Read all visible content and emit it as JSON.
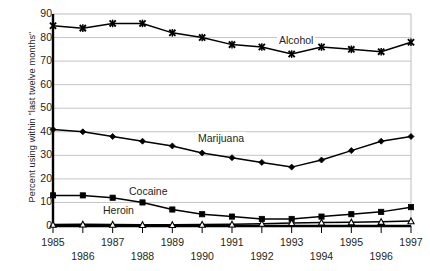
{
  "chart_data": {
    "type": "line",
    "title": "",
    "xlabel": "",
    "ylabel": "Percent using within \"last twelve months\"",
    "x": [
      1985,
      1986,
      1987,
      1988,
      1989,
      1990,
      1991,
      1992,
      1993,
      1994,
      1995,
      1996,
      1997
    ],
    "categories": [
      "1985",
      "1986",
      "1987",
      "1988",
      "1989",
      "1990",
      "1991",
      "1992",
      "1993",
      "1994",
      "1995",
      "1996",
      "1997"
    ],
    "xlim": [
      1985,
      1997
    ],
    "ylim": [
      0,
      90
    ],
    "yticks": [
      0,
      10,
      20,
      30,
      40,
      50,
      60,
      70,
      80,
      90
    ],
    "ytick_labels": [
      "0",
      "10",
      "20",
      "30",
      "40",
      "50",
      "60",
      "70",
      "80",
      "90"
    ],
    "grid": "horizontal",
    "legend": "inline-labels",
    "series": [
      {
        "name": "Alcohol",
        "marker": "x-cross",
        "values": [
          85,
          84,
          86,
          86,
          82,
          80,
          77,
          76,
          73,
          76,
          75,
          74,
          78
        ]
      },
      {
        "name": "Marijuana",
        "marker": "diamond",
        "values": [
          41,
          40,
          38,
          36,
          34,
          31,
          29,
          27,
          25,
          28,
          32,
          36,
          38
        ]
      },
      {
        "name": "Cocaine",
        "marker": "square",
        "values": [
          13,
          13,
          12,
          10,
          7,
          5,
          4,
          3,
          3,
          4,
          5,
          6,
          8
        ]
      },
      {
        "name": "Heroin",
        "marker": "triangle-open",
        "values": [
          0.6,
          0.7,
          0.6,
          0.5,
          0.5,
          0.6,
          0.7,
          1.0,
          1.3,
          1.5,
          1.6,
          1.8,
          2.1
        ]
      }
    ],
    "series_label_positions": [
      {
        "name": "Alcohol",
        "x": 277,
        "y": 34
      },
      {
        "name": "Marijuana",
        "x": 196,
        "y": 132
      },
      {
        "name": "Cocaine",
        "x": 127,
        "y": 185
      },
      {
        "name": "Heroin",
        "x": 101,
        "y": 204
      }
    ],
    "colors": {
      "line": "#000000",
      "grid": "#b5b5b5",
      "axis": "#000000",
      "text": "#231f20",
      "background": "#ffffff"
    }
  }
}
